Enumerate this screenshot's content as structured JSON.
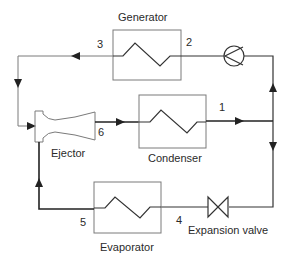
{
  "diagram": {
    "components": {
      "generator": {
        "label": "Generator"
      },
      "condenser": {
        "label": "Condenser"
      },
      "evaporator": {
        "label": "Evaporator"
      },
      "ejector": {
        "label": "Ejector"
      },
      "expansion_valve": {
        "label": "Expansion valve"
      },
      "pump": {
        "label": ""
      }
    },
    "state_points": {
      "p1": "1",
      "p2": "2",
      "p3": "3",
      "p4": "4",
      "p5": "5",
      "p6": "6"
    },
    "colors": {
      "line": "#333333",
      "box": "#7a7a7a",
      "background": "#ffffff"
    }
  }
}
